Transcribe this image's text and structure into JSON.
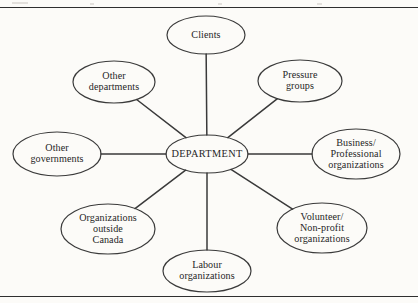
{
  "page": {
    "background_color": "#fcfbf8",
    "stroke_color": "#3a3a3a",
    "text_color": "#262626",
    "rules": [
      "top-rule",
      "bottom-rule"
    ]
  },
  "diagram": {
    "type": "hub-and-spoke",
    "hub": {
      "label": "DEPARTMENT",
      "cx": 207,
      "cy": 154,
      "rx": 41,
      "ry": 19
    },
    "satellites": [
      {
        "name": "clients",
        "label": "Clients",
        "lines": [
          "Clients"
        ],
        "cx": 206,
        "cy": 35,
        "rx": 39,
        "ry": 19
      },
      {
        "name": "other-departments",
        "label": "Other departments",
        "lines": [
          "Other",
          "departments"
        ],
        "cx": 114,
        "cy": 82,
        "rx": 41,
        "ry": 21
      },
      {
        "name": "pressure-groups",
        "label": "Pressure groups",
        "lines": [
          "Pressure",
          "groups"
        ],
        "cx": 300,
        "cy": 81,
        "rx": 42,
        "ry": 21
      },
      {
        "name": "other-governments",
        "label": "Other governments",
        "lines": [
          "Other",
          "governments"
        ],
        "cx": 57,
        "cy": 154,
        "rx": 44,
        "ry": 22
      },
      {
        "name": "business-professional-organizations",
        "label": "Business/ Professional organizations",
        "lines": [
          "Business/",
          "Professional",
          "organizations"
        ],
        "cx": 356,
        "cy": 154,
        "rx": 44,
        "ry": 25
      },
      {
        "name": "organizations-outside-canada",
        "label": "Organizations outside Canada",
        "lines": [
          "Organizations",
          "outside",
          "Canada"
        ],
        "cx": 108,
        "cy": 229,
        "rx": 47,
        "ry": 25
      },
      {
        "name": "volunteer-non-profit-organizations",
        "label": "Volunteer/ Non-profit organizations",
        "lines": [
          "Volunteer/",
          "Non-profit",
          "organizations"
        ],
        "cx": 322,
        "cy": 228,
        "rx": 45,
        "ry": 25
      },
      {
        "name": "labour-organizations",
        "label": "Labour organizations",
        "lines": [
          "Labour",
          "organizations"
        ],
        "cx": 207,
        "cy": 271,
        "rx": 44,
        "ry": 21
      }
    ],
    "connectors": [
      {
        "from": "department",
        "to": "clients"
      },
      {
        "from": "department",
        "to": "other-departments"
      },
      {
        "from": "department",
        "to": "pressure-groups"
      },
      {
        "from": "department",
        "to": "other-governments"
      },
      {
        "from": "department",
        "to": "business-professional-organizations"
      },
      {
        "from": "department",
        "to": "organizations-outside-canada"
      },
      {
        "from": "department",
        "to": "volunteer-non-profit-organizations"
      },
      {
        "from": "department",
        "to": "labour-organizations"
      }
    ]
  }
}
